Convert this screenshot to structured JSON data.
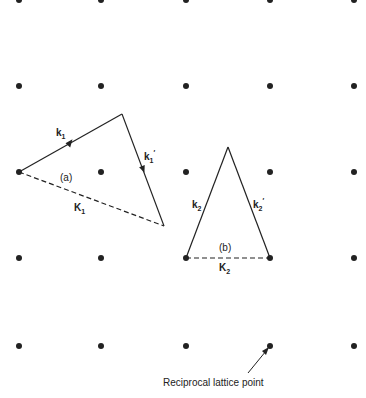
{
  "diagram": {
    "lattice": {
      "xs": [
        19,
        101,
        186,
        270,
        354
      ],
      "ys": [
        0,
        86,
        172,
        258,
        346
      ],
      "dot_color": "#222222"
    },
    "triangle_a": {
      "label": "(a)",
      "k_label": "k",
      "k_sub": "1",
      "kprime_label": "k",
      "kprime_sub": "1",
      "kprime_mark": "′",
      "K_label": "K",
      "K_sub": "1"
    },
    "triangle_b": {
      "label": "(b)",
      "k_label": "k",
      "k_sub": "2",
      "kprime_label": "k",
      "kprime_sub": "2",
      "kprime_mark": "′",
      "K_label": "K",
      "K_sub": "2"
    },
    "annotation": {
      "text": "Reciprocal lattice point"
    }
  }
}
